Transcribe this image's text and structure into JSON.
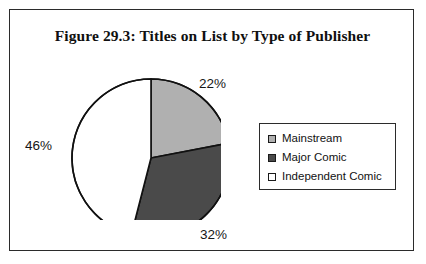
{
  "figure": {
    "title": "Figure 29.3: Titles on List by Type of Publisher",
    "frame_color": "#2b2b2b",
    "background": "#ffffff"
  },
  "chart_data": {
    "type": "pie",
    "title": "Figure 29.3: Titles on List by Type of Publisher",
    "xlabel": "",
    "ylabel": "",
    "legend_position": "right",
    "grid": false,
    "start_angle_deg": 0,
    "direction": "clockwise",
    "categories": [
      "Mainstream",
      "Major Comic",
      "Independent Comic"
    ],
    "values": [
      22,
      32,
      46
    ],
    "value_unit": "%",
    "data_labels": [
      "22%",
      "32%",
      "46%"
    ],
    "colors": [
      "#b0b0b0",
      "#4a4a4a",
      "#ffffff"
    ],
    "slice_outline_color": "#111111",
    "slices": [
      {
        "label": "Mainstream",
        "value": 22,
        "data_label": "22%",
        "color": "#b0b0b0",
        "start_deg": 0,
        "end_deg": 79.2
      },
      {
        "label": "Major Comic",
        "value": 32,
        "data_label": "32%",
        "color": "#4a4a4a",
        "start_deg": 79.2,
        "end_deg": 194.4
      },
      {
        "label": "Independent Comic",
        "value": 46,
        "data_label": "46%",
        "color": "#ffffff",
        "start_deg": 194.4,
        "end_deg": 360
      }
    ]
  },
  "labels": {
    "mainstream_pct": "22%",
    "major_pct": "32%",
    "independent_pct": "46%"
  },
  "legend": {
    "items": [
      {
        "label": "Mainstream",
        "swatch": "#b0b0b0"
      },
      {
        "label": "Major Comic",
        "swatch": "#4a4a4a"
      },
      {
        "label": "Independent Comic",
        "swatch": "#ffffff"
      }
    ]
  }
}
